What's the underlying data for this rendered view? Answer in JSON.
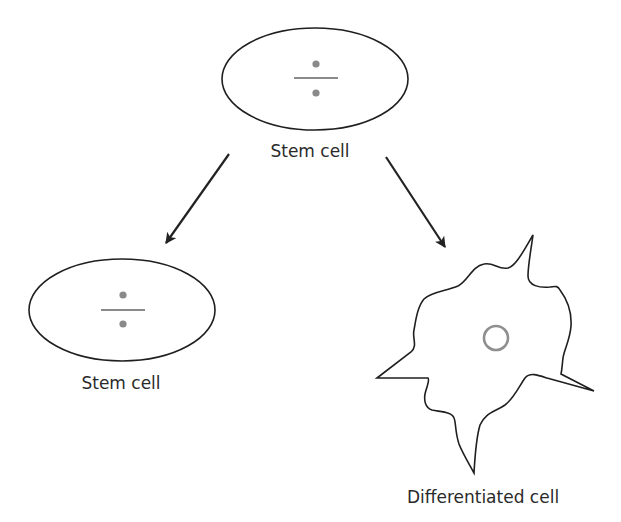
{
  "diagram": {
    "nodes": {
      "parent": {
        "label": "Stem cell",
        "shape": "ellipse",
        "symbol": "division-sign"
      },
      "daughter_stem": {
        "label": "Stem cell",
        "shape": "ellipse",
        "symbol": "division-sign"
      },
      "daughter_differentiated": {
        "label": "Differentiated cell",
        "shape": "irregular-star",
        "symbol": "nucleus-circle"
      }
    },
    "edges": [
      {
        "from": "parent",
        "to": "daughter_stem",
        "type": "arrow"
      },
      {
        "from": "parent",
        "to": "daughter_differentiated",
        "type": "arrow"
      }
    ],
    "colors": {
      "outline": "#1f1f1f",
      "symbol": "#8a8a8a",
      "text": "#2a2a2a",
      "background": "#ffffff"
    }
  }
}
